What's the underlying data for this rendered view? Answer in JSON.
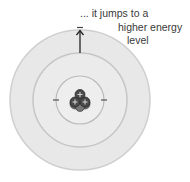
{
  "caption": {
    "line1": "... it jumps to a",
    "line2": "higher energy",
    "line3": "level"
  },
  "atom": {
    "center": [
      80,
      100
    ],
    "shells": [
      {
        "name": "outer-shell",
        "radius": 70,
        "fill": "#e8e8e8",
        "stroke": "#cfcfcf"
      },
      {
        "name": "middle-shell",
        "radius": 47,
        "fill": "#ebebeb",
        "stroke": "#c8c8c8"
      },
      {
        "name": "inner-shell",
        "radius": 24,
        "fill": "#eeeeee",
        "stroke": "#bdbdbd"
      }
    ],
    "nucleus": {
      "protons": 3,
      "proton_symbol": "+",
      "color": "#4a4a4a"
    },
    "electrons": [
      {
        "shell": "inner",
        "position": "left",
        "symbol": "-"
      },
      {
        "shell": "inner",
        "position": "right",
        "symbol": "-"
      },
      {
        "shell": "outer",
        "position": "top",
        "symbol": "-"
      }
    ],
    "arrow": {
      "from_shell": "middle",
      "to_shell": "outer",
      "direction": "up"
    }
  }
}
